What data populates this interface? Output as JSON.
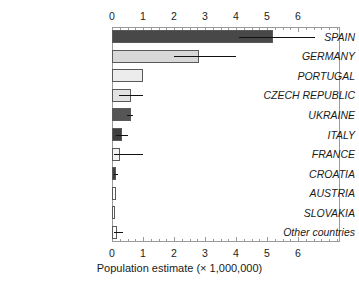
{
  "chart_data": {
    "type": "bar",
    "orientation": "horizontal",
    "title": "",
    "xlabel": "Population estimate (× 1,000,000)",
    "ylabel": "",
    "xlim": [
      0,
      7.35
    ],
    "xticks": [
      0,
      1,
      2,
      3,
      4,
      5,
      6
    ],
    "xtick_labels": [
      "0",
      "1",
      "2",
      "3",
      "4",
      "5",
      "6"
    ],
    "minor_tick_step": 0.25,
    "grid": false,
    "legend": null,
    "axis_top": true,
    "axis_bottom": true,
    "categories": [
      "SPAIN",
      "GERMANY",
      "PORTUGAL",
      "CZECH REPUBLIC",
      "UKRAINE",
      "ITALY",
      "FRANCE",
      "CROATIA",
      "AUSTRIA",
      "SLOVAKIA",
      "Other countries"
    ],
    "values": [
      5.2,
      2.82,
      1.0,
      0.62,
      0.62,
      0.32,
      0.25,
      0.14,
      0.12,
      0.07,
      0.15
    ],
    "error_low": [
      4.1,
      2.0,
      null,
      0.22,
      0.48,
      0.12,
      0.05,
      0.05,
      null,
      null,
      0.06
    ],
    "error_high": [
      6.55,
      4.0,
      null,
      1.0,
      0.68,
      0.52,
      1.0,
      0.2,
      null,
      null,
      0.37
    ],
    "bar_colors": [
      "#484848",
      "#d8d8d8",
      "#ececec",
      "#e2e2e2",
      "#555555",
      "#3f3f3f",
      "#f2f2f2",
      "#3f3f3f",
      "#ffffff",
      "#ffffff",
      "#ffffff"
    ],
    "bar_edge_color": "#5a5a5a",
    "error_color": "#111111"
  },
  "axis": {
    "x_label_text": "Population estimate (× 1,000,000)"
  }
}
